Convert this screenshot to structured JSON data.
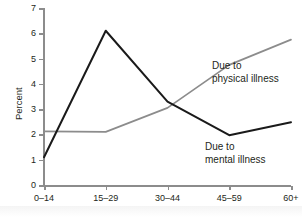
{
  "chart_data": {
    "type": "line",
    "title": "",
    "xlabel": "",
    "ylabel": "Percent",
    "categories": [
      "0–14",
      "15–29",
      "30–44",
      "45–59",
      "60+"
    ],
    "ylim": [
      0,
      7
    ],
    "yticks": [
      0,
      1,
      2,
      3,
      4,
      5,
      6,
      7
    ],
    "grid": false,
    "legend_position": "inline-annotations",
    "series": [
      {
        "name": "Due to mental illness",
        "color": "#1a1a1a",
        "values": [
          1.1,
          6.1,
          3.3,
          1.97,
          2.48
        ]
      },
      {
        "name": "Due to physical illness",
        "color": "#8c8c8c",
        "values": [
          2.12,
          2.1,
          3.05,
          4.75,
          5.75
        ]
      }
    ],
    "annotations": [
      {
        "id": "physical",
        "line1": "Due to",
        "line2": "physical illness"
      },
      {
        "id": "mental",
        "line1": "Due to",
        "line2": "mental illness"
      }
    ]
  },
  "axis": {
    "y_title": "Percent",
    "y_tick_labels": [
      "0",
      "1",
      "2",
      "3",
      "4",
      "5",
      "6",
      "7"
    ],
    "x_tick_labels": [
      "0–14",
      "15–29",
      "30–44",
      "45–59",
      "60+"
    ]
  },
  "colors": {
    "mental_line": "#1a1a1a",
    "physical_line": "#8c8c8c",
    "axis": "#8c8c8c",
    "text": "#231f20",
    "background": "#ffffff"
  }
}
